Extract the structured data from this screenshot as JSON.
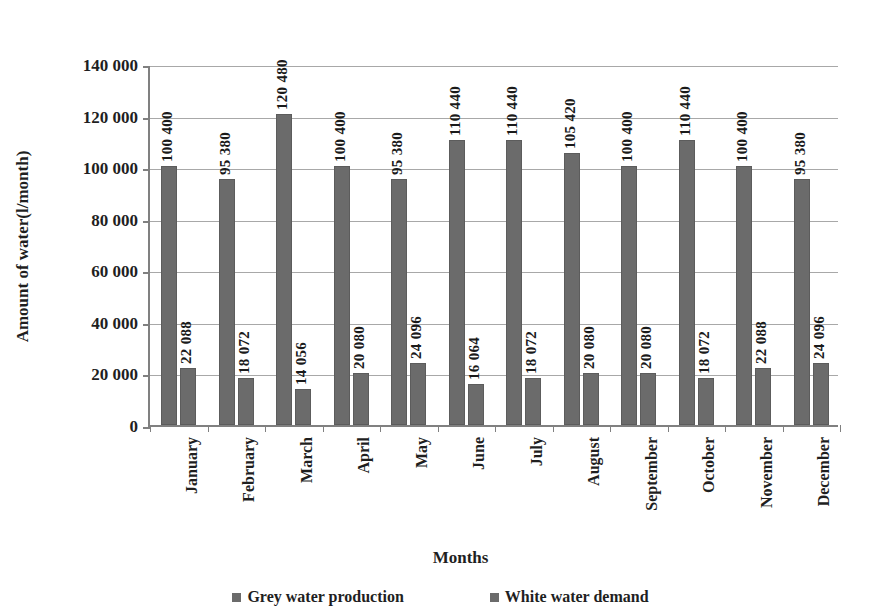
{
  "chart_data": {
    "type": "bar",
    "title": "",
    "xlabel": "Months",
    "ylabel": "Amount of water(l/month)",
    "ylim": [
      0,
      140000
    ],
    "ytick_labels": [
      "0",
      "20 000",
      "40 000",
      "60 000",
      "80 000",
      "100 000",
      "120 000",
      "140 000"
    ],
    "ytick_values": [
      0,
      20000,
      40000,
      60000,
      80000,
      100000,
      120000,
      140000
    ],
    "grid": true,
    "legend_position": "bottom",
    "categories": [
      "January",
      "February",
      "March",
      "April",
      "May",
      "June",
      "July",
      "August",
      "September",
      "October",
      "November",
      "December"
    ],
    "series": [
      {
        "name": "Grey water production",
        "color": "#6b6b6b",
        "values": [
          100400,
          95380,
          120480,
          100400,
          95380,
          110440,
          110440,
          105420,
          100400,
          110440,
          100400,
          95380
        ],
        "labels": [
          "100 400",
          "95 380",
          "120 480",
          "100 400",
          "95 380",
          "110 440",
          "110 440",
          "105 420",
          "100 400",
          "110 440",
          "100 400",
          "95 380"
        ]
      },
      {
        "name": "White water demand",
        "color": "#6b6b6b",
        "values": [
          22088,
          18072,
          14056,
          20080,
          24096,
          16064,
          18072,
          20080,
          20080,
          18072,
          22088,
          24096
        ],
        "labels": [
          "22 088",
          "18 072",
          "14 056",
          "20 080",
          "24 096",
          "16 064",
          "18 072",
          "20 080",
          "20 080",
          "18 072",
          "22 088",
          "24 096"
        ]
      }
    ]
  },
  "legend": {
    "items": [
      {
        "label": "Grey water production"
      },
      {
        "label": "White water demand"
      }
    ]
  },
  "axes": {
    "x_title": "Months",
    "y_title": "Amount of water(l/month)"
  }
}
